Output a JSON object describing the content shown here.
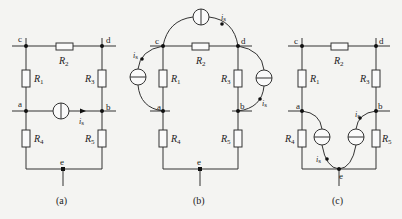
{
  "figure": {
    "panels": [
      {
        "caption": "(a)",
        "nodes": {
          "c": "c",
          "d": "d",
          "a": "a",
          "b": "b",
          "e": "e"
        },
        "resistors": {
          "R1": "R",
          "R1_sub": "1",
          "R2": "R",
          "R2_sub": "2",
          "R3": "R",
          "R3_sub": "3",
          "R4": "R",
          "R4_sub": "4",
          "R5": "R",
          "R5_sub": "5"
        },
        "sources": [
          {
            "label": "i",
            "label_sub": "s",
            "between": "a-b",
            "direction": "a→b"
          }
        ]
      },
      {
        "caption": "(b)",
        "nodes": {
          "c": "c",
          "d": "d",
          "a": "a",
          "b": "b",
          "e": "e"
        },
        "resistors": {
          "R1": "R",
          "R1_sub": "1",
          "R2": "R",
          "R2_sub": "2",
          "R3": "R",
          "R3_sub": "3",
          "R4": "R",
          "R4_sub": "4",
          "R5": "R",
          "R5_sub": "5"
        },
        "sources": [
          {
            "label": "i",
            "label_sub": "s",
            "between": "a-c",
            "direction": "a→c"
          },
          {
            "label": "i",
            "label_sub": "s",
            "between": "c-d",
            "direction": "c→d"
          },
          {
            "label": "i",
            "label_sub": "s",
            "between": "d-b",
            "direction": "d→b"
          }
        ]
      },
      {
        "caption": "(c)",
        "nodes": {
          "c": "c",
          "d": "d",
          "a": "a",
          "b": "b",
          "e": "e"
        },
        "resistors": {
          "R1": "R",
          "R1_sub": "1",
          "R2": "R",
          "R2_sub": "2",
          "R3": "R",
          "R3_sub": "3",
          "R4": "R",
          "R4_sub": "4",
          "R5": "R",
          "R5_sub": "5"
        },
        "sources": [
          {
            "label": "i",
            "label_sub": "s",
            "between": "a-e",
            "direction": "a→e"
          },
          {
            "label": "i",
            "label_sub": "s",
            "between": "e-b",
            "direction": "e→b"
          }
        ]
      }
    ]
  }
}
